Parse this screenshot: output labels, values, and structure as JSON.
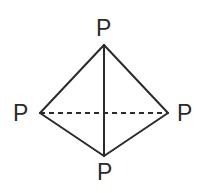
{
  "figure": {
    "kind": "molecular-structure-diagram",
    "molecule": "P4 tetrahedron",
    "background_color": "#ffffff",
    "stroke_color": "#2b2b2b",
    "stroke_width": 2,
    "width": 201,
    "height": 193
  },
  "atoms": [
    {
      "id": "p-top",
      "label": "P",
      "position": "top",
      "x": 104,
      "y": 45
    },
    {
      "id": "p-left",
      "label": "P",
      "position": "left",
      "x": 40,
      "y": 113
    },
    {
      "id": "p-right",
      "label": "P",
      "position": "right",
      "x": 168,
      "y": 113
    },
    {
      "id": "p-bottom",
      "label": "P",
      "position": "bottom",
      "x": 104,
      "y": 156
    }
  ],
  "bonds": [
    {
      "id": "bond-top-left",
      "from": "p-top",
      "to": "p-left",
      "style": "solid",
      "x1": 104,
      "y1": 45,
      "x2": 40,
      "y2": 113
    },
    {
      "id": "bond-top-right",
      "from": "p-top",
      "to": "p-right",
      "style": "solid",
      "x1": 104,
      "y1": 45,
      "x2": 168,
      "y2": 113
    },
    {
      "id": "bond-top-bottom",
      "from": "p-top",
      "to": "p-bottom",
      "style": "solid",
      "x1": 104,
      "y1": 45,
      "x2": 104,
      "y2": 156
    },
    {
      "id": "bond-left-bottom",
      "from": "p-left",
      "to": "p-bottom",
      "style": "solid",
      "x1": 40,
      "y1": 113,
      "x2": 104,
      "y2": 156
    },
    {
      "id": "bond-right-bottom",
      "from": "p-right",
      "to": "p-bottom",
      "style": "solid",
      "x1": 168,
      "y1": 113,
      "x2": 104,
      "y2": 156
    },
    {
      "id": "bond-left-right",
      "from": "p-left",
      "to": "p-right",
      "style": "dashed",
      "x1": 40,
      "y1": 113,
      "x2": 168,
      "y2": 113,
      "dash_pattern": "5,4"
    }
  ]
}
